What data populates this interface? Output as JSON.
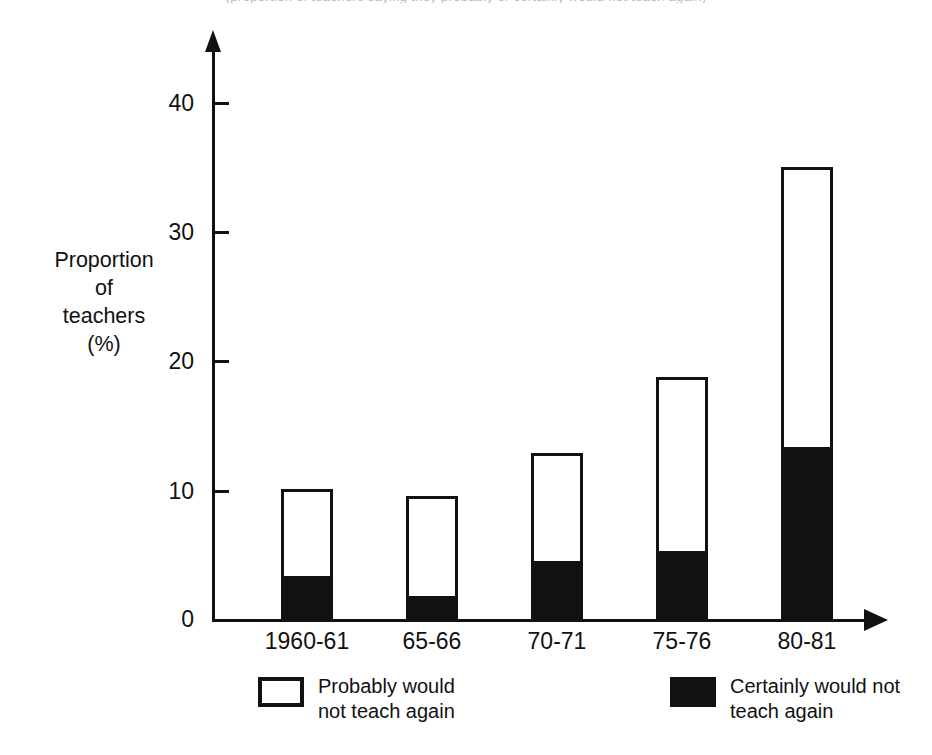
{
  "top_caption_clipped": "(proportion of teachers saying they probably or certainly would not teach again)",
  "chart_data": {
    "type": "bar",
    "subtype": "stacked",
    "title": "",
    "xlabel": "",
    "ylabel": "Proportion of teachers (%)",
    "ylabel_lines": [
      "Proportion",
      "of",
      "teachers",
      "(%)"
    ],
    "categories": [
      "1960-61",
      "65-66",
      "70-71",
      "75-76",
      "80-81"
    ],
    "series": [
      {
        "name": "Certainly would not teach again",
        "color": "#111111",
        "values": [
          3.4,
          1.9,
          4.6,
          5.4,
          13.4
        ]
      },
      {
        "name": "Probably would not teach again",
        "color": "#ffffff",
        "values": [
          6.7,
          7.7,
          8.3,
          13.4,
          21.6
        ]
      }
    ],
    "totals": [
      10.1,
      9.6,
      12.9,
      18.8,
      35.0
    ],
    "ylim": [
      0,
      40
    ],
    "yticks": [
      0,
      10,
      20,
      30,
      40
    ],
    "ytick_labels": [
      "0",
      "10",
      "20",
      "30",
      "40"
    ],
    "grid": false,
    "legend_position": "bottom"
  },
  "axis": {
    "y_title_lines": [
      "Proportion",
      "of",
      "teachers",
      "(%)"
    ],
    "y_tick_labels": [
      "40",
      "30",
      "20",
      "10",
      "0"
    ],
    "x_tick_labels": [
      "1960-61",
      "65-66",
      "70-71",
      "75-76",
      "80-81"
    ]
  },
  "legend": {
    "items": [
      {
        "swatch": "hollow",
        "line1": "Probably would",
        "line2": "not teach again"
      },
      {
        "swatch": "filled",
        "line1": "Certainly would not",
        "line2": "teach again"
      }
    ]
  }
}
